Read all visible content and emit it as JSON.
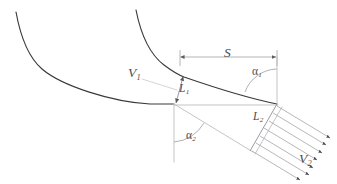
{
  "figure": {
    "type": "technical-line-diagram",
    "background_color": "#ffffff",
    "blade_stroke_color": "#3a3a3c",
    "construction_stroke_color": "#b9b9bd",
    "label_color": "#4b4b50"
  },
  "labels": {
    "inlet_velocity": {
      "symbol": "V",
      "subscript": "1",
      "meaning": "inlet relative velocity"
    },
    "outlet_velocity": {
      "symbol": "V",
      "subscript": "2",
      "meaning": "outlet relative velocity"
    },
    "inlet_throat": {
      "symbol": "L",
      "subscript": "1",
      "meaning": "inlet throat width"
    },
    "outlet_throat": {
      "symbol": "L",
      "subscript": "2",
      "meaning": "outlet throat width"
    },
    "pitch": {
      "symbol": "S",
      "subscript": "",
      "meaning": "blade pitch / spacing"
    },
    "outlet_angle": {
      "symbol": "α",
      "subscript": "1",
      "meaning": "flow angle at outlet plane"
    },
    "inlet_angle": {
      "symbol": "α",
      "subscript": "2",
      "meaning": "flow angle measured from vertical"
    }
  },
  "geometry": {
    "lower_blade_curve": "M16,12 C22,38 34,63 60,78 C100,100 150,112 174,104",
    "upper_blade_curve": "M135,10 C142,32 152,56 170,68 C200,85 250,100 277,104",
    "pitch_line": {
      "x1": 180,
      "y1": 57,
      "x2": 277,
      "y2": 57
    },
    "pitch_tick_left": {
      "x": 180,
      "y1": 49,
      "y2": 65
    },
    "pitch_tick_right": {
      "x": 277,
      "y1": 49,
      "y2": 65
    },
    "throat1_line": {
      "x1": 182,
      "y1": 76,
      "x2": 175,
      "y2": 104
    },
    "throat2_line": {
      "x1": 277,
      "y1": 104,
      "x2": 250,
      "y2": 150
    },
    "horizontal_reference": {
      "x1": 174,
      "y1": 105,
      "x2": 278,
      "y2": 105
    },
    "vertical_reference": {
      "x": 174,
      "y1": 104,
      "y2": 162
    },
    "angle1_vertex": {
      "x": 277,
      "y": 104
    },
    "angle2_vertex": {
      "x": 174,
      "y": 104
    },
    "outlet_flow_direction_deg": 31,
    "velocity_profile_arrow_count": 7
  },
  "velocity_profile": {
    "description": "Uniform outlet velocity vectors V2 leaving the throat L2",
    "arrows": [
      {
        "x1": 276,
        "y1": 106,
        "x2": 331,
        "y2": 139
      },
      {
        "x1": 272,
        "y1": 113,
        "x2": 327,
        "y2": 146
      },
      {
        "x1": 268,
        "y1": 121,
        "x2": 323,
        "y2": 154
      },
      {
        "x1": 263,
        "y1": 128,
        "x2": 318,
        "y2": 161
      },
      {
        "x1": 259,
        "y1": 135,
        "x2": 314,
        "y2": 168
      },
      {
        "x1": 255,
        "y1": 143,
        "x2": 310,
        "y2": 176
      },
      {
        "x1": 251,
        "y1": 150,
        "x2": 306,
        "y2": 183
      }
    ]
  }
}
